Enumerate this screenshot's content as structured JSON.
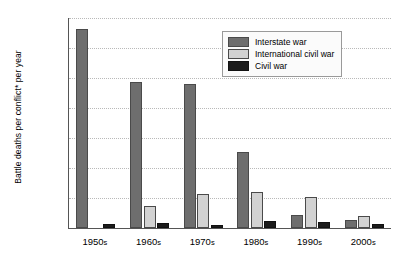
{
  "chart_data": {
    "type": "bar",
    "title": "",
    "xlabel": "",
    "ylabel": "Battle deaths per conflict* per year",
    "categories": [
      "1950s",
      "1960s",
      "1970s",
      "1980s",
      "1990s",
      "2000s"
    ],
    "ylim": [
      0,
      70000
    ],
    "ytick_values": [
      0,
      10000,
      20000,
      30000,
      40000,
      50000,
      60000,
      70000
    ],
    "ytick_labels": [
      "0",
      "10,000",
      "20,000",
      "30,000",
      "40,000",
      "50,000",
      "60,000",
      "70,000"
    ],
    "grid": "horizontal-dotted",
    "legend_position": "top-right-inside",
    "series": [
      {
        "name": "Interstate war",
        "color": "#6e6e6e",
        "values": [
          66500,
          48800,
          48000,
          25200,
          4200,
          2800
        ]
      },
      {
        "name": "International civil war",
        "color": "#d2d2d2",
        "values": [
          0,
          7400,
          11200,
          12000,
          10200,
          4100
        ]
      },
      {
        "name": "Civil war",
        "color": "#1b1b1b",
        "values": [
          1400,
          1800,
          900,
          2200,
          1900,
          1500
        ]
      }
    ]
  }
}
